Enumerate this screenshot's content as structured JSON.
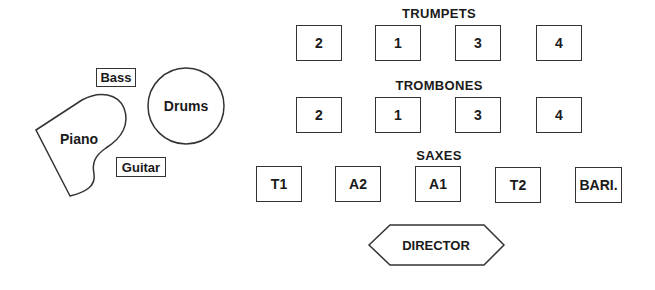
{
  "diagram": {
    "type": "stage-seating-chart",
    "rhythm_section": {
      "piano": "Piano",
      "drums": "Drums",
      "bass": "Bass",
      "guitar": "Guitar"
    },
    "sections": [
      {
        "title": "TRUMPETS",
        "chairs": [
          "2",
          "1",
          "3",
          "4"
        ]
      },
      {
        "title": "TROMBONES",
        "chairs": [
          "2",
          "1",
          "3",
          "4"
        ]
      },
      {
        "title": "SAXES",
        "chairs": [
          "T1",
          "A2",
          "A1",
          "T2",
          "BARI."
        ]
      }
    ],
    "director": "DIRECTOR"
  }
}
